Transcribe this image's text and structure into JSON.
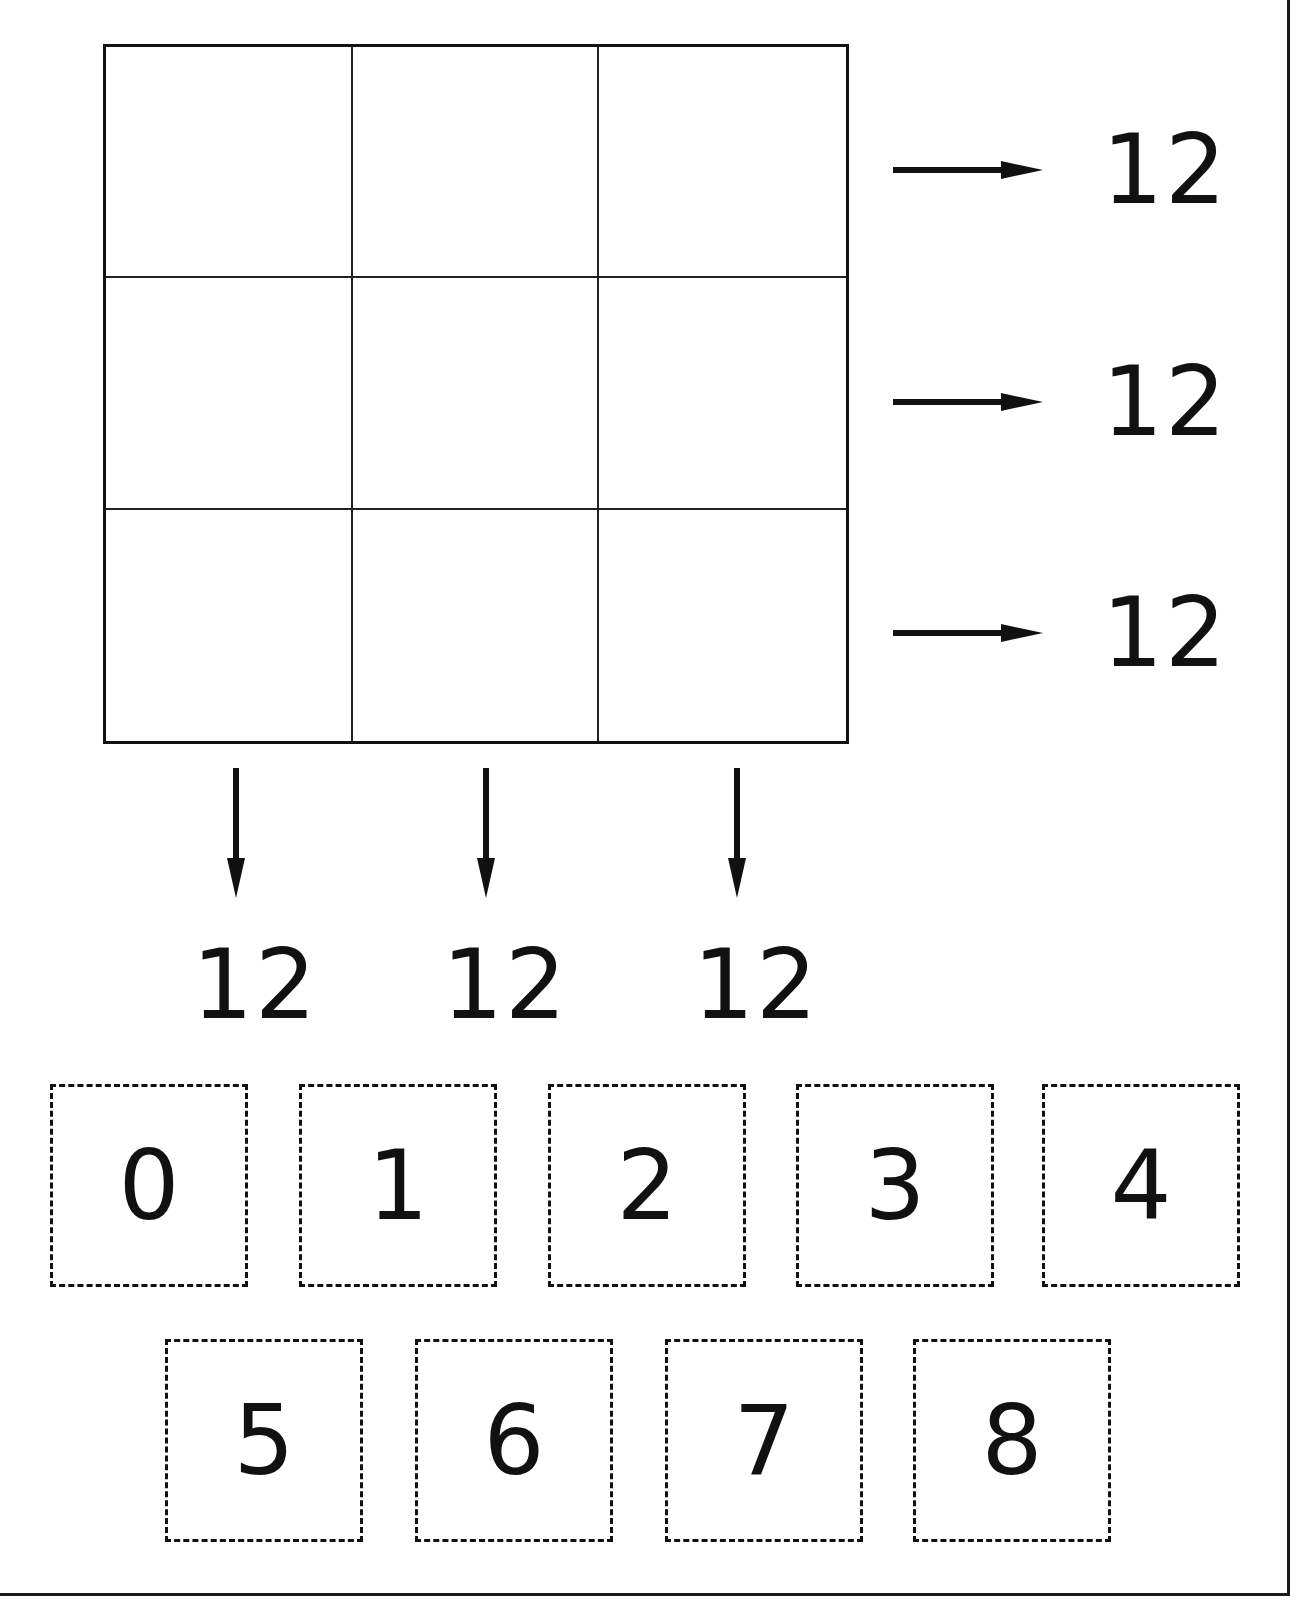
{
  "puzzle": {
    "grid": {
      "rows": 3,
      "cols": 3,
      "cells": [
        [
          "",
          "",
          ""
        ],
        [
          "",
          "",
          ""
        ],
        [
          "",
          "",
          ""
        ]
      ]
    },
    "row_sums": [
      "12",
      "12",
      "12"
    ],
    "column_sums": [
      "12",
      "12",
      "12"
    ]
  },
  "tiles": {
    "row1": [
      "0",
      "1",
      "2",
      "3",
      "4"
    ],
    "row2": [
      "5",
      "6",
      "7",
      "8"
    ]
  },
  "icons": {
    "row_arrow": "arrow-right-icon",
    "column_arrow": "arrow-down-icon"
  },
  "colors": {
    "ink": "#111111",
    "background": "#ffffff"
  }
}
